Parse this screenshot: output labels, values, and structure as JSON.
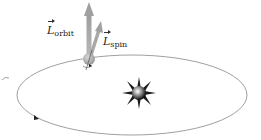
{
  "figure": {
    "labels": {
      "orbit": {
        "symbol": "L",
        "subscript": "orbit"
      },
      "spin": {
        "symbol": "L",
        "subscript": "spin"
      }
    },
    "colors": {
      "background": "#ffffff",
      "orbit_line": "#9a9a9a",
      "vector": "#a8a8a8",
      "planet": "#b5b5b5",
      "star_core": "#ffffff",
      "star_dark": "#1a1a1a"
    },
    "geometry": {
      "orbit_center": [
        132,
        95
      ],
      "orbit_rx": 115,
      "orbit_ry": 40,
      "planet_center": [
        89,
        59
      ],
      "star_center": [
        139,
        93
      ]
    }
  }
}
